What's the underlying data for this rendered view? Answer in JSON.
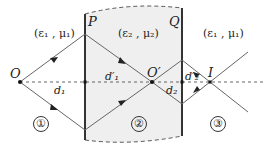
{
  "diagram": {
    "type": "ray optics through slab (negative index medium)",
    "media": {
      "left": {
        "label": "(ε₁ , μ₁)",
        "region": "①"
      },
      "slab": {
        "label": "(ε₂ , μ₂)",
        "region": "②"
      },
      "right": {
        "label": "(ε₁ , μ₁)",
        "region": "③"
      }
    },
    "interfaces": {
      "left": "P",
      "right": "Q"
    },
    "points": {
      "source": "O",
      "intermediate_image": "O′",
      "final_image": "I"
    },
    "distances": {
      "d1": "d₁",
      "d1_prime": "d′₁",
      "d2": "d₂",
      "d2_prime": "d′₂"
    },
    "colors": {
      "slab_fill": "#efefef",
      "ray": "#555555",
      "interface": "#333333",
      "axis": "#555555"
    }
  }
}
